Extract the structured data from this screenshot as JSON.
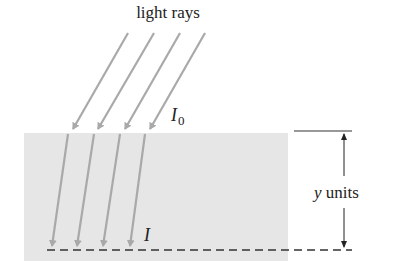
{
  "diagram": {
    "title_label": "light rays",
    "surface_intensity_label": "I",
    "surface_intensity_sub": "0",
    "depth_intensity_label": "I",
    "depth_label_var": "y",
    "depth_label_units": " units",
    "colors": {
      "medium": "#e6e6e6",
      "ray": "#a9a9a9",
      "line": "#333333",
      "text": "#222222"
    },
    "rays": [
      {
        "x1": 128,
        "y1": 33,
        "xs": 73,
        "ys": 131,
        "x2": 52,
        "y2": 248
      },
      {
        "x1": 154,
        "y1": 33,
        "xs": 98,
        "ys": 131,
        "x2": 77,
        "y2": 248
      },
      {
        "x1": 180,
        "y1": 33,
        "xs": 125,
        "ys": 131,
        "x2": 103,
        "y2": 248
      },
      {
        "x1": 205,
        "y1": 33,
        "xs": 150,
        "ys": 131,
        "x2": 130,
        "y2": 248
      }
    ]
  }
}
